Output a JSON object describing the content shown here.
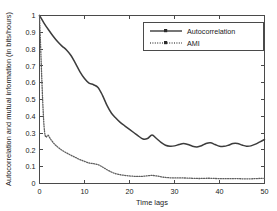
{
  "chart_data": {
    "type": "line",
    "title": "",
    "xlabel": "Time lags",
    "ylabel": "Autocorrelation and mutual information (in bits/hours)",
    "xlim": [
      0,
      50
    ],
    "ylim": [
      0,
      1
    ],
    "xticks": [
      0,
      10,
      20,
      30,
      40,
      50
    ],
    "xticklabels": [
      "0",
      "10",
      "20",
      "30",
      "40",
      "50"
    ],
    "yticks": [
      0,
      0.1,
      0.2,
      0.3,
      0.4,
      0.5,
      0.6,
      0.7,
      0.8,
      0.9,
      1
    ],
    "yticklabels": [
      "0",
      "0.1",
      "0.2",
      "0.3",
      "0.4",
      "0.5",
      "0.6",
      "0.7",
      "0.8",
      "0.9",
      "1"
    ],
    "grid": false,
    "legend_position": "upper right",
    "x": [
      0,
      1,
      2,
      3,
      4,
      5,
      6,
      7,
      8,
      9,
      10,
      11,
      12,
      13,
      14,
      15,
      16,
      17,
      18,
      19,
      20,
      21,
      22,
      23,
      24,
      25,
      26,
      27,
      28,
      29,
      30,
      31,
      32,
      33,
      34,
      35,
      36,
      37,
      38,
      39,
      40,
      41,
      42,
      43,
      44,
      45,
      46,
      47,
      48,
      49,
      50
    ],
    "series": [
      {
        "name": "Autocorrelation",
        "linestyle": "solid",
        "marker": "square",
        "color": "#3c3c3c",
        "values": [
          1.0,
          0.955,
          0.915,
          0.878,
          0.845,
          0.818,
          0.795,
          0.762,
          0.715,
          0.665,
          0.625,
          0.598,
          0.588,
          0.572,
          0.525,
          0.465,
          0.418,
          0.388,
          0.362,
          0.342,
          0.322,
          0.302,
          0.282,
          0.265,
          0.268,
          0.288,
          0.268,
          0.245,
          0.228,
          0.222,
          0.224,
          0.232,
          0.238,
          0.232,
          0.222,
          0.218,
          0.225,
          0.238,
          0.242,
          0.232,
          0.222,
          0.221,
          0.228,
          0.238,
          0.238,
          0.229,
          0.222,
          0.224,
          0.234,
          0.248,
          0.262
        ]
      },
      {
        "name": "AMI",
        "linestyle": "dotted",
        "marker": "square",
        "color": "#5e5e5e",
        "values": [
          1.0,
          0.345,
          0.285,
          0.245,
          0.218,
          0.198,
          0.182,
          0.168,
          0.155,
          0.142,
          0.132,
          0.122,
          0.118,
          0.112,
          0.098,
          0.082,
          0.068,
          0.058,
          0.052,
          0.048,
          0.045,
          0.043,
          0.042,
          0.043,
          0.046,
          0.048,
          0.045,
          0.04,
          0.036,
          0.034,
          0.033,
          0.033,
          0.033,
          0.032,
          0.031,
          0.03,
          0.03,
          0.031,
          0.031,
          0.03,
          0.029,
          0.029,
          0.029,
          0.029,
          0.029,
          0.028,
          0.028,
          0.028,
          0.029,
          0.03,
          0.031
        ]
      }
    ],
    "legend": [
      "Autocorrelation",
      "AMI"
    ]
  }
}
